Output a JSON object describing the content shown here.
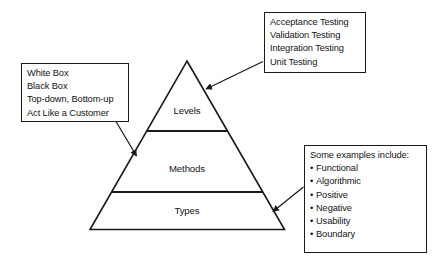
{
  "diagram": {
    "stroke_color": "#1a1a1a",
    "background_color": "#ffffff",
    "pyramid": {
      "tiers": [
        {
          "id": "levels",
          "label": "Levels"
        },
        {
          "id": "methods",
          "label": "Methods"
        },
        {
          "id": "types",
          "label": "Types"
        }
      ]
    },
    "callouts": {
      "levels": {
        "id": "callout-levels",
        "points_to": "Levels",
        "lines": [
          "Acceptance Testing",
          "Validation Testing",
          "Integration Testing",
          "Unit Testing"
        ]
      },
      "methods": {
        "id": "callout-methods",
        "points_to": "Methods",
        "lines": [
          "White Box",
          "Black Box",
          "Top-down, Bottom-up",
          "Act Like a Customer"
        ]
      },
      "types": {
        "id": "callout-types",
        "points_to": "Types",
        "heading": "Some examples include:",
        "bullet_char": "•",
        "bullets": [
          "Functional",
          "Algorithmic",
          "Positive",
          "Negative",
          "Usability",
          "Boundary"
        ]
      }
    }
  }
}
